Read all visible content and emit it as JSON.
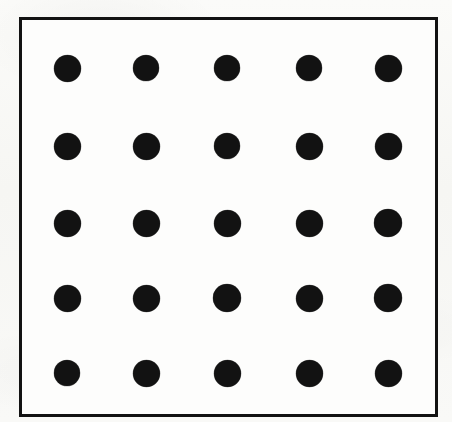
{
  "figure": {
    "canvas": {
      "width": 452,
      "height": 422
    },
    "background_color": "#f8f8f6",
    "paper_color": "#fdfdfc"
  },
  "border": {
    "name": "rectangle-frame",
    "color": "#121212",
    "thickness": 3.5,
    "x": 19,
    "y": 17,
    "width": 419,
    "height": 400
  },
  "dots": {
    "count": 25,
    "rows": 5,
    "columns": 5,
    "color": "#121212",
    "diameter": 26,
    "column_centers_x": [
      67,
      146,
      227,
      309,
      388
    ],
    "row_centers_y": [
      68,
      146,
      223,
      298,
      373
    ],
    "items": [
      {
        "row": 1,
        "col": 1,
        "cx": 67,
        "cy": 68,
        "r": 13.5
      },
      {
        "row": 1,
        "col": 2,
        "cx": 146,
        "cy": 68,
        "r": 13.0
      },
      {
        "row": 1,
        "col": 3,
        "cx": 227,
        "cy": 68,
        "r": 13.0
      },
      {
        "row": 1,
        "col": 4,
        "cx": 309,
        "cy": 68,
        "r": 13.0
      },
      {
        "row": 1,
        "col": 5,
        "cx": 388,
        "cy": 68,
        "r": 13.5
      },
      {
        "row": 2,
        "col": 1,
        "cx": 67,
        "cy": 146,
        "r": 13.5
      },
      {
        "row": 2,
        "col": 2,
        "cx": 146,
        "cy": 146,
        "r": 13.5
      },
      {
        "row": 2,
        "col": 3,
        "cx": 227,
        "cy": 146,
        "r": 13.0
      },
      {
        "row": 2,
        "col": 4,
        "cx": 309,
        "cy": 146,
        "r": 13.5
      },
      {
        "row": 2,
        "col": 5,
        "cx": 388,
        "cy": 146,
        "r": 13.5
      },
      {
        "row": 3,
        "col": 1,
        "cx": 67,
        "cy": 223,
        "r": 13.5
      },
      {
        "row": 3,
        "col": 2,
        "cx": 146,
        "cy": 223,
        "r": 13.5
      },
      {
        "row": 3,
        "col": 3,
        "cx": 227,
        "cy": 223,
        "r": 13.5
      },
      {
        "row": 3,
        "col": 4,
        "cx": 309,
        "cy": 223,
        "r": 13.5
      },
      {
        "row": 3,
        "col": 5,
        "cx": 388,
        "cy": 223,
        "r": 14.0
      },
      {
        "row": 4,
        "col": 1,
        "cx": 67,
        "cy": 298,
        "r": 13.5
      },
      {
        "row": 4,
        "col": 2,
        "cx": 146,
        "cy": 298,
        "r": 13.5
      },
      {
        "row": 4,
        "col": 3,
        "cx": 227,
        "cy": 298,
        "r": 14.0
      },
      {
        "row": 4,
        "col": 4,
        "cx": 309,
        "cy": 298,
        "r": 13.5
      },
      {
        "row": 4,
        "col": 5,
        "cx": 388,
        "cy": 298,
        "r": 14.0
      },
      {
        "row": 5,
        "col": 1,
        "cx": 67,
        "cy": 373,
        "r": 13.0
      },
      {
        "row": 5,
        "col": 2,
        "cx": 146,
        "cy": 373,
        "r": 13.5
      },
      {
        "row": 5,
        "col": 3,
        "cx": 227,
        "cy": 373,
        "r": 13.5
      },
      {
        "row": 5,
        "col": 4,
        "cx": 309,
        "cy": 373,
        "r": 13.5
      },
      {
        "row": 5,
        "col": 5,
        "cx": 388,
        "cy": 373,
        "r": 13.5
      }
    ]
  }
}
